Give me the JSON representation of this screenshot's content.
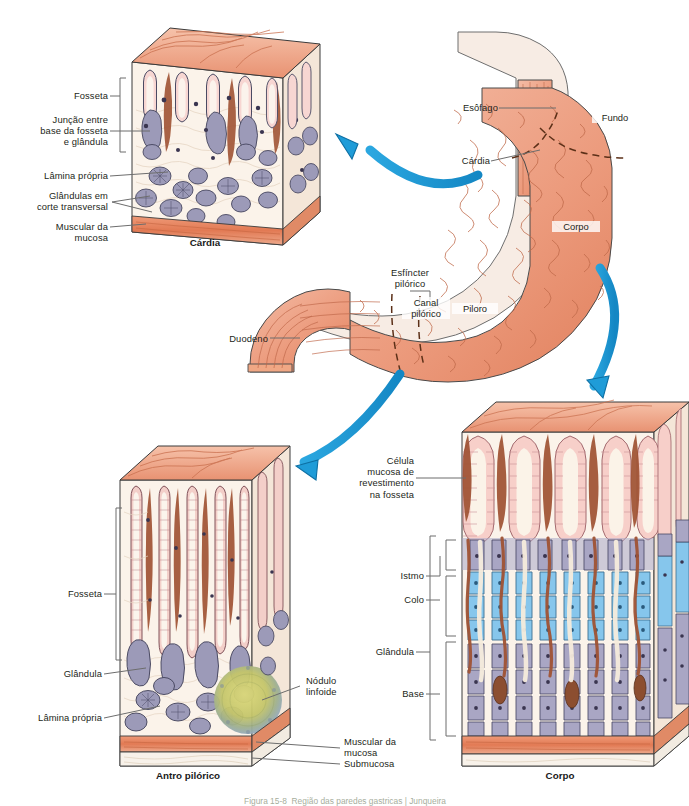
{
  "figure": {
    "background": "#ffffff",
    "arrow_color": "#1f9cd8",
    "arrow_outline": "#0d6fa3",
    "caption": "Figura 15-8  Região das paredes gastricas | Junqueira",
    "caption_visible_fragment": "Figura 15-8"
  },
  "panels": {
    "cardia": {
      "caption": "Cárdia",
      "labels": [
        {
          "key": "fosseta",
          "text": "Fosseta"
        },
        {
          "key": "juncao",
          "text": "Junção entre\nbase da fosseta\ne glândula"
        },
        {
          "key": "lamina_propria",
          "text": "Lâmina própria"
        },
        {
          "key": "glandulas_corte",
          "text": "Glândulas em\ncorte transversal"
        },
        {
          "key": "muscular_mucosa",
          "text": "Muscular da\nmucosa"
        }
      ]
    },
    "stomach": {
      "labels": [
        {
          "key": "esofago",
          "text": "Esôfago"
        },
        {
          "key": "fundo",
          "text": "Fundo"
        },
        {
          "key": "cardia",
          "text": "Cárdia"
        },
        {
          "key": "corpo",
          "text": "Corpo"
        },
        {
          "key": "esfincter_pilorico",
          "text": "Esfíncter\npilórico"
        },
        {
          "key": "canal_pilorico",
          "text": "Canal\npilórico"
        },
        {
          "key": "piloro",
          "text": "Piloro"
        },
        {
          "key": "duodeno",
          "text": "Duodeno"
        }
      ]
    },
    "antro": {
      "caption": "Antro pilórico",
      "labels": [
        {
          "key": "fosseta",
          "text": "Fosseta"
        },
        {
          "key": "glandula",
          "text": "Glândula"
        },
        {
          "key": "lamina_propria",
          "text": "Lâmina própria"
        },
        {
          "key": "nodulo_linfoide",
          "text": "Nódulo\nlinfoide"
        },
        {
          "key": "muscular_mucosa",
          "text": "Muscular da\nmucosa"
        },
        {
          "key": "submucosa",
          "text": "Submucosa"
        }
      ]
    },
    "corpo": {
      "caption": "Corpo",
      "labels": [
        {
          "key": "celula_mucosa",
          "text": "Célula\nmucosa de\nrevestimento\nna fosseta"
        },
        {
          "key": "istmo",
          "text": "Istmo"
        },
        {
          "key": "colo",
          "text": "Colo"
        },
        {
          "key": "glandula",
          "text": "Glândula"
        },
        {
          "key": "base",
          "text": "Base"
        }
      ]
    }
  },
  "colors": {
    "mucosa_surface": "#e8866a",
    "mucosa_surface_light": "#f0a98f",
    "pit_epithelium": "#f5c9c5",
    "lamina_propria": "#f7ece2",
    "gland_gray": "#a9a6c2",
    "gland_blue": "#82c4ea",
    "brown_stroma": "#a05334",
    "muscularis": "#e8815f",
    "submucosa": "#f6efe6",
    "nodule_core": "#cfd06a",
    "nodule_rim": "#8fa8c4",
    "leader_line": "#6d6d6d"
  }
}
